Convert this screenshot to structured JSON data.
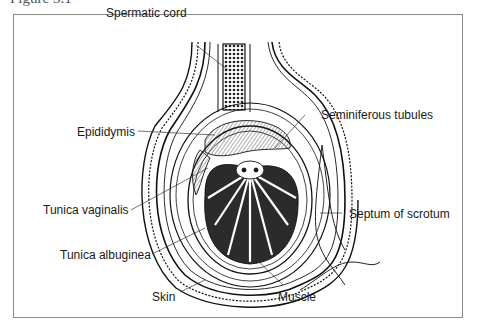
{
  "figure": {
    "caption_partial": "Figure 3.1"
  },
  "diagram": {
    "labels": [
      {
        "id": "spermatic-cord",
        "text": "Spermatic cord"
      },
      {
        "id": "seminiferous-tubules",
        "text": "Seminiferous tubules"
      },
      {
        "id": "epididymis",
        "text": "Epididymis"
      },
      {
        "id": "tunica-vaginalis",
        "text": "Tunica vaginalis"
      },
      {
        "id": "septum-of-scrotum",
        "text": "Septum of scrotum"
      },
      {
        "id": "tunica-albuginea",
        "text": "Tunica albuginea"
      },
      {
        "id": "skin",
        "text": "Skin"
      },
      {
        "id": "muscle",
        "text": "Muscle"
      }
    ]
  }
}
